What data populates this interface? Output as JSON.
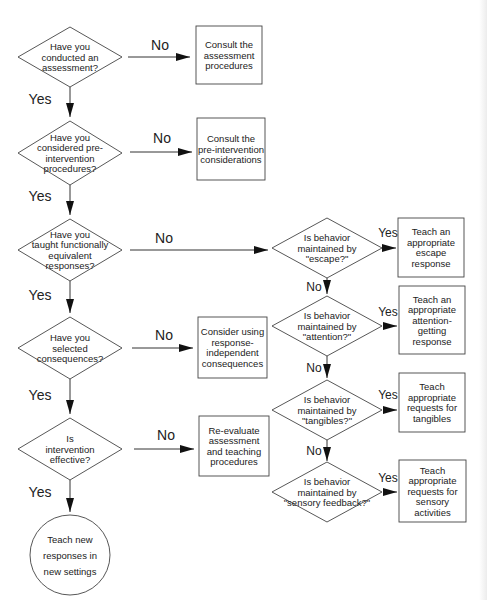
{
  "diagram": {
    "type": "flowchart",
    "nodes": [
      {
        "id": "d1",
        "shape": "diamond",
        "lines": [
          "Have you",
          "conducted an",
          "assessment?"
        ]
      },
      {
        "id": "b1",
        "shape": "box",
        "lines": [
          "Consult the",
          "assessment",
          "procedures"
        ]
      },
      {
        "id": "d2",
        "shape": "diamond",
        "lines": [
          "Have you",
          "considered pre-",
          "intervention",
          "procedures?"
        ]
      },
      {
        "id": "b2",
        "shape": "box",
        "lines": [
          "Consult the",
          "pre-intervention",
          "considerations"
        ]
      },
      {
        "id": "d3",
        "shape": "diamond",
        "lines": [
          "Have you",
          "taught functionally",
          "equivalent",
          "responses?"
        ]
      },
      {
        "id": "d4",
        "shape": "diamond",
        "lines": [
          "Have you",
          "selected",
          "consequences?"
        ]
      },
      {
        "id": "b4",
        "shape": "box",
        "lines": [
          "Consider using",
          "response-",
          "independent",
          "consequences"
        ]
      },
      {
        "id": "d5",
        "shape": "diamond",
        "lines": [
          "Is",
          "intervention",
          "effective?"
        ]
      },
      {
        "id": "b5",
        "shape": "box",
        "lines": [
          "Re-evaluate",
          "assessment",
          "and teaching",
          "procedures"
        ]
      },
      {
        "id": "c1",
        "shape": "circle",
        "lines": [
          "Teach new",
          "responses in",
          "new settings"
        ]
      },
      {
        "id": "e1",
        "shape": "diamond",
        "lines": [
          "Is behavior",
          "maintained by",
          "\"escape?\""
        ]
      },
      {
        "id": "r1",
        "shape": "box",
        "lines": [
          "Teach an",
          "appropriate",
          "escape",
          "response"
        ]
      },
      {
        "id": "e2",
        "shape": "diamond",
        "lines": [
          "Is behavior",
          "maintained by",
          "\"attention?\""
        ]
      },
      {
        "id": "r2",
        "shape": "box",
        "lines": [
          "Teach an",
          "appropriate",
          "attention-",
          "getting",
          "response"
        ]
      },
      {
        "id": "e3",
        "shape": "diamond",
        "lines": [
          "Is behavior",
          "maintained by",
          "\"tangibles?\""
        ]
      },
      {
        "id": "r3",
        "shape": "box",
        "lines": [
          "Teach",
          "appropriate",
          "requests for",
          "tangibles"
        ]
      },
      {
        "id": "e4",
        "shape": "diamond",
        "lines": [
          "Is behavior",
          "maintained by",
          "\"sensory feedback?\""
        ]
      },
      {
        "id": "r4",
        "shape": "box",
        "lines": [
          "Teach",
          "appropriate",
          "requests for",
          "sensory",
          "activities"
        ]
      }
    ],
    "edges": [
      {
        "from": "d1",
        "to": "b1",
        "label": "No"
      },
      {
        "from": "d1",
        "to": "d2",
        "label": "Yes"
      },
      {
        "from": "d2",
        "to": "b2",
        "label": "No"
      },
      {
        "from": "d2",
        "to": "d3",
        "label": "Yes"
      },
      {
        "from": "d3",
        "to": "e1",
        "label": "No"
      },
      {
        "from": "d3",
        "to": "d4",
        "label": "Yes"
      },
      {
        "from": "d4",
        "to": "b4",
        "label": "No"
      },
      {
        "from": "d4",
        "to": "d5",
        "label": "Yes"
      },
      {
        "from": "d5",
        "to": "b5",
        "label": "No"
      },
      {
        "from": "d5",
        "to": "c1",
        "label": "Yes"
      },
      {
        "from": "e1",
        "to": "r1",
        "label": "Yes"
      },
      {
        "from": "e1",
        "to": "e2",
        "label": "No"
      },
      {
        "from": "e2",
        "to": "r2",
        "label": "Yes"
      },
      {
        "from": "e2",
        "to": "e3",
        "label": "No"
      },
      {
        "from": "e3",
        "to": "r3",
        "label": "Yes"
      },
      {
        "from": "e3",
        "to": "e4",
        "label": "No"
      },
      {
        "from": "e4",
        "to": "r4",
        "label": "Yes"
      }
    ]
  }
}
